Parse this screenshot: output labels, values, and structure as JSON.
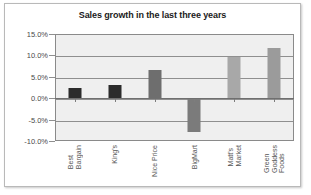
{
  "chart_data": {
    "type": "bar",
    "title": "Sales growth in the last three years",
    "xlabel": "",
    "ylabel": "",
    "ylim": [
      -10.0,
      15.0
    ],
    "ytick_labels": [
      "15.0%",
      "10.0%",
      "5.0%",
      "0.0%",
      "-5.0%",
      "-10.0%"
    ],
    "ytick_values": [
      15.0,
      10.0,
      5.0,
      0.0,
      -5.0,
      -10.0
    ],
    "grid": true,
    "legend": "none",
    "categories": [
      "Best Bargain",
      "King's",
      "Nice Price",
      "BigMart",
      "Matt's Market",
      "Green Goddess Foods"
    ],
    "category_label_lines": [
      [
        "Best",
        "Bargain"
      ],
      [
        "King's"
      ],
      [
        "Nice Price"
      ],
      [
        "BigMart"
      ],
      [
        "Matt's",
        "Market"
      ],
      [
        "Green",
        "Goddess",
        "Foods"
      ]
    ],
    "values": [
      2.3,
      3.1,
      6.5,
      -7.8,
      9.7,
      11.8
    ],
    "bar_colors": [
      "#2b2b2b",
      "#2b2b2b",
      "#6e6e6e",
      "#7b7b7b",
      "#a8a8a8",
      "#9b9b9b"
    ]
  },
  "style": {
    "plot_background": "#efefef",
    "gridline_color": "#8f8f8f",
    "frame_color": "#8a8a8a",
    "card_border": "#b9b9b9",
    "title_color": "#1b1b1b",
    "tick_text_color": "#4a4a4a",
    "category_text_color": "#555555"
  }
}
